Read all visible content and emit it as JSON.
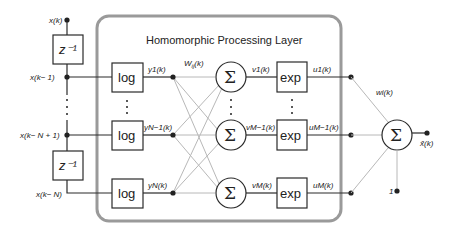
{
  "diagram": {
    "title": "Homomorphic Processing Layer",
    "colors": {
      "line": "#2a2a2a",
      "weight_line": "#b8b8b8",
      "panel_border": "#9a9a9a",
      "background": "#ffffff"
    },
    "inputs": {
      "labels": [
        "x(k)",
        "x(k− 1)",
        "x(k− N + 1)",
        "x(k− N)"
      ],
      "delay_blocks": [
        "z⁻¹",
        "z⁻¹"
      ]
    },
    "log_blocks": {
      "label": "log",
      "count_shown": 3
    },
    "log_outputs": [
      "y₁(k)",
      "yₙ₋₁(k)",
      "yₙ(k)"
    ],
    "log_outputs_text": [
      "y1(k)",
      "yN−1(k)",
      "yN(k)"
    ],
    "inner_weight_label": "Wᵢⱼ(k)",
    "sum_symbol": "Σ",
    "sum_outputs": [
      "v1(k)",
      "vM−1(k)",
      "vM(k)"
    ],
    "exp_blocks": {
      "label": "exp",
      "count_shown": 3
    },
    "exp_outputs": [
      "u1(k)",
      "uM−1(k)",
      "uM(k)"
    ],
    "output_weight_label": "wi(k)",
    "bias_label": "1",
    "output_label": "x̂(k)"
  }
}
